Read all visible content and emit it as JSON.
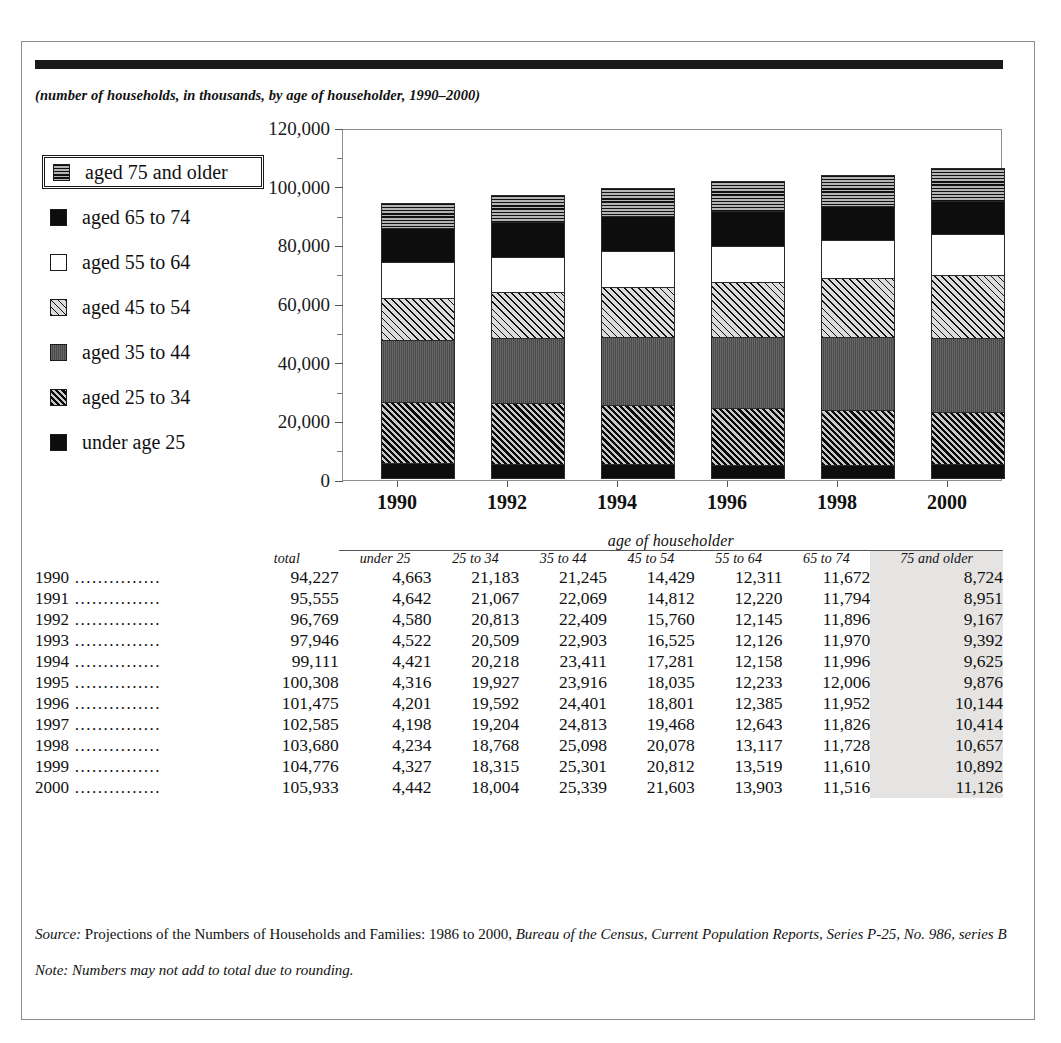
{
  "subtitle": "(number of households, in thousands, by age of householder, 1990–2000)",
  "legend": {
    "items": [
      {
        "label": "aged 75 and older",
        "pattern": "horizontal-lines-gray",
        "boxed": true
      },
      {
        "label": "aged 65 to 74",
        "pattern": "solid-black",
        "boxed": false
      },
      {
        "label": "aged 55 to 64",
        "pattern": "white",
        "boxed": false
      },
      {
        "label": "aged 45 to 54",
        "pattern": "diagonal-hatch-light",
        "boxed": false
      },
      {
        "label": "aged 35 to 44",
        "pattern": "solid-dark-gray",
        "boxed": false
      },
      {
        "label": "aged 25 to 34",
        "pattern": "diagonal-hatch-dark",
        "boxed": false
      },
      {
        "label": "under age 25",
        "pattern": "solid-black",
        "boxed": false
      }
    ]
  },
  "chart_data": {
    "type": "bar",
    "subtype": "stacked",
    "title": "",
    "xlabel": "",
    "ylabel": "",
    "ylim": [
      0,
      120000
    ],
    "grid": false,
    "legend_position": "left",
    "ytick_labels": [
      "120,000",
      "100,000",
      "80,000",
      "60,000",
      "40,000",
      "20,000",
      "0"
    ],
    "ytick_values": [
      120000,
      100000,
      80000,
      60000,
      40000,
      20000,
      0
    ],
    "minor_tick_values": [
      110000,
      90000,
      70000,
      50000,
      30000,
      10000
    ],
    "categories": [
      "1990",
      "1992",
      "1994",
      "1996",
      "1998",
      "2000"
    ],
    "series": [
      {
        "name": "under age 25",
        "values": [
          4663,
          4580,
          4421,
          4201,
          4234,
          4442
        ]
      },
      {
        "name": "aged 25 to 34",
        "values": [
          21183,
          20813,
          20218,
          19592,
          18768,
          18004
        ]
      },
      {
        "name": "aged 35 to 44",
        "values": [
          21245,
          22409,
          23411,
          24401,
          25098,
          25339
        ]
      },
      {
        "name": "aged 45 to 54",
        "values": [
          14429,
          15760,
          17281,
          18801,
          20078,
          21603
        ]
      },
      {
        "name": "aged 55 to 64",
        "values": [
          12311,
          12145,
          12158,
          12385,
          13117,
          13903
        ]
      },
      {
        "name": "aged 65 to 74",
        "values": [
          11672,
          11896,
          11996,
          11952,
          11728,
          11516
        ]
      },
      {
        "name": "aged 75 and older",
        "values": [
          8724,
          9167,
          9625,
          10144,
          10657,
          11126
        ]
      }
    ],
    "totals": [
      94227,
      96769,
      99111,
      101475,
      103680,
      105933
    ]
  },
  "table": {
    "group_header": "age of householder",
    "columns": [
      "",
      "total",
      "under 25",
      "25 to 34",
      "35 to 44",
      "45 to 54",
      "55 to 64",
      "65 to 74",
      "75 and older"
    ],
    "leader": "...............",
    "highlight_column": "75 and older",
    "rows": [
      {
        "year": "1990",
        "total": "94,227",
        "cells": [
          "4,663",
          "21,183",
          "21,245",
          "14,429",
          "12,311",
          "11,672",
          "8,724"
        ]
      },
      {
        "year": "1991",
        "total": "95,555",
        "cells": [
          "4,642",
          "21,067",
          "22,069",
          "14,812",
          "12,220",
          "11,794",
          "8,951"
        ]
      },
      {
        "year": "1992",
        "total": "96,769",
        "cells": [
          "4,580",
          "20,813",
          "22,409",
          "15,760",
          "12,145",
          "11,896",
          "9,167"
        ]
      },
      {
        "year": "1993",
        "total": "97,946",
        "cells": [
          "4,522",
          "20,509",
          "22,903",
          "16,525",
          "12,126",
          "11,970",
          "9,392"
        ]
      },
      {
        "year": "1994",
        "total": "99,111",
        "cells": [
          "4,421",
          "20,218",
          "23,411",
          "17,281",
          "12,158",
          "11,996",
          "9,625"
        ]
      },
      {
        "year": "1995",
        "total": "100,308",
        "cells": [
          "4,316",
          "19,927",
          "23,916",
          "18,035",
          "12,233",
          "12,006",
          "9,876"
        ]
      },
      {
        "year": "1996",
        "total": "101,475",
        "cells": [
          "4,201",
          "19,592",
          "24,401",
          "18,801",
          "12,385",
          "11,952",
          "10,144"
        ]
      },
      {
        "year": "1997",
        "total": "102,585",
        "cells": [
          "4,198",
          "19,204",
          "24,813",
          "19,468",
          "12,643",
          "11,826",
          "10,414"
        ]
      },
      {
        "year": "1998",
        "total": "103,680",
        "cells": [
          "4,234",
          "18,768",
          "25,098",
          "20,078",
          "13,117",
          "11,728",
          "10,657"
        ]
      },
      {
        "year": "1999",
        "total": "104,776",
        "cells": [
          "4,327",
          "18,315",
          "25,301",
          "20,812",
          "13,519",
          "11,610",
          "10,892"
        ]
      },
      {
        "year": "2000",
        "total": "105,933",
        "cells": [
          "4,442",
          "18,004",
          "25,339",
          "21,603",
          "13,903",
          "11,516",
          "11,126"
        ]
      }
    ]
  },
  "notes": {
    "source_label": "Source:",
    "source_plain_1": " Projections of the Numbers of Households and Families: 1986 to 2000, ",
    "source_italic": "Bureau of the Census, Current Population Reports, Series P-25, No. 986, series B",
    "note_label": "Note:",
    "note_text": " Numbers may not add to total due to rounding."
  },
  "colors": {
    "rule": "#1a1a1a",
    "border": "#8d8d8d",
    "highlight": "#e6e4e2"
  }
}
